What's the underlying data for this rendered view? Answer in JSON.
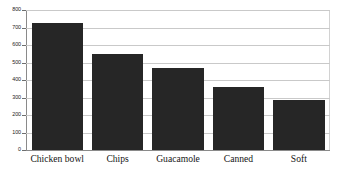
{
  "chart_data": {
    "type": "bar",
    "title": "",
    "subtitle": "",
    "xlabel": "",
    "ylabel": "",
    "categories": [
      "Chicken bowl",
      "Chips",
      "Guacamole",
      "Canned",
      "Soft"
    ],
    "values": [
      725,
      550,
      470,
      360,
      285
    ],
    "ylim": [
      0,
      800
    ],
    "yticks": [
      0,
      100,
      200,
      300,
      400,
      500,
      600,
      700,
      800
    ],
    "ytick_labels": [
      "0",
      "100",
      "200",
      "300",
      "400",
      "500",
      "600",
      "700",
      "800"
    ],
    "grid": true,
    "legend": false,
    "legend_position": "none",
    "bar_color": "#262626",
    "gridline_color": "#c9c9c9",
    "axis_color": "#8a8a8a",
    "background_color": "#ffffff"
  }
}
